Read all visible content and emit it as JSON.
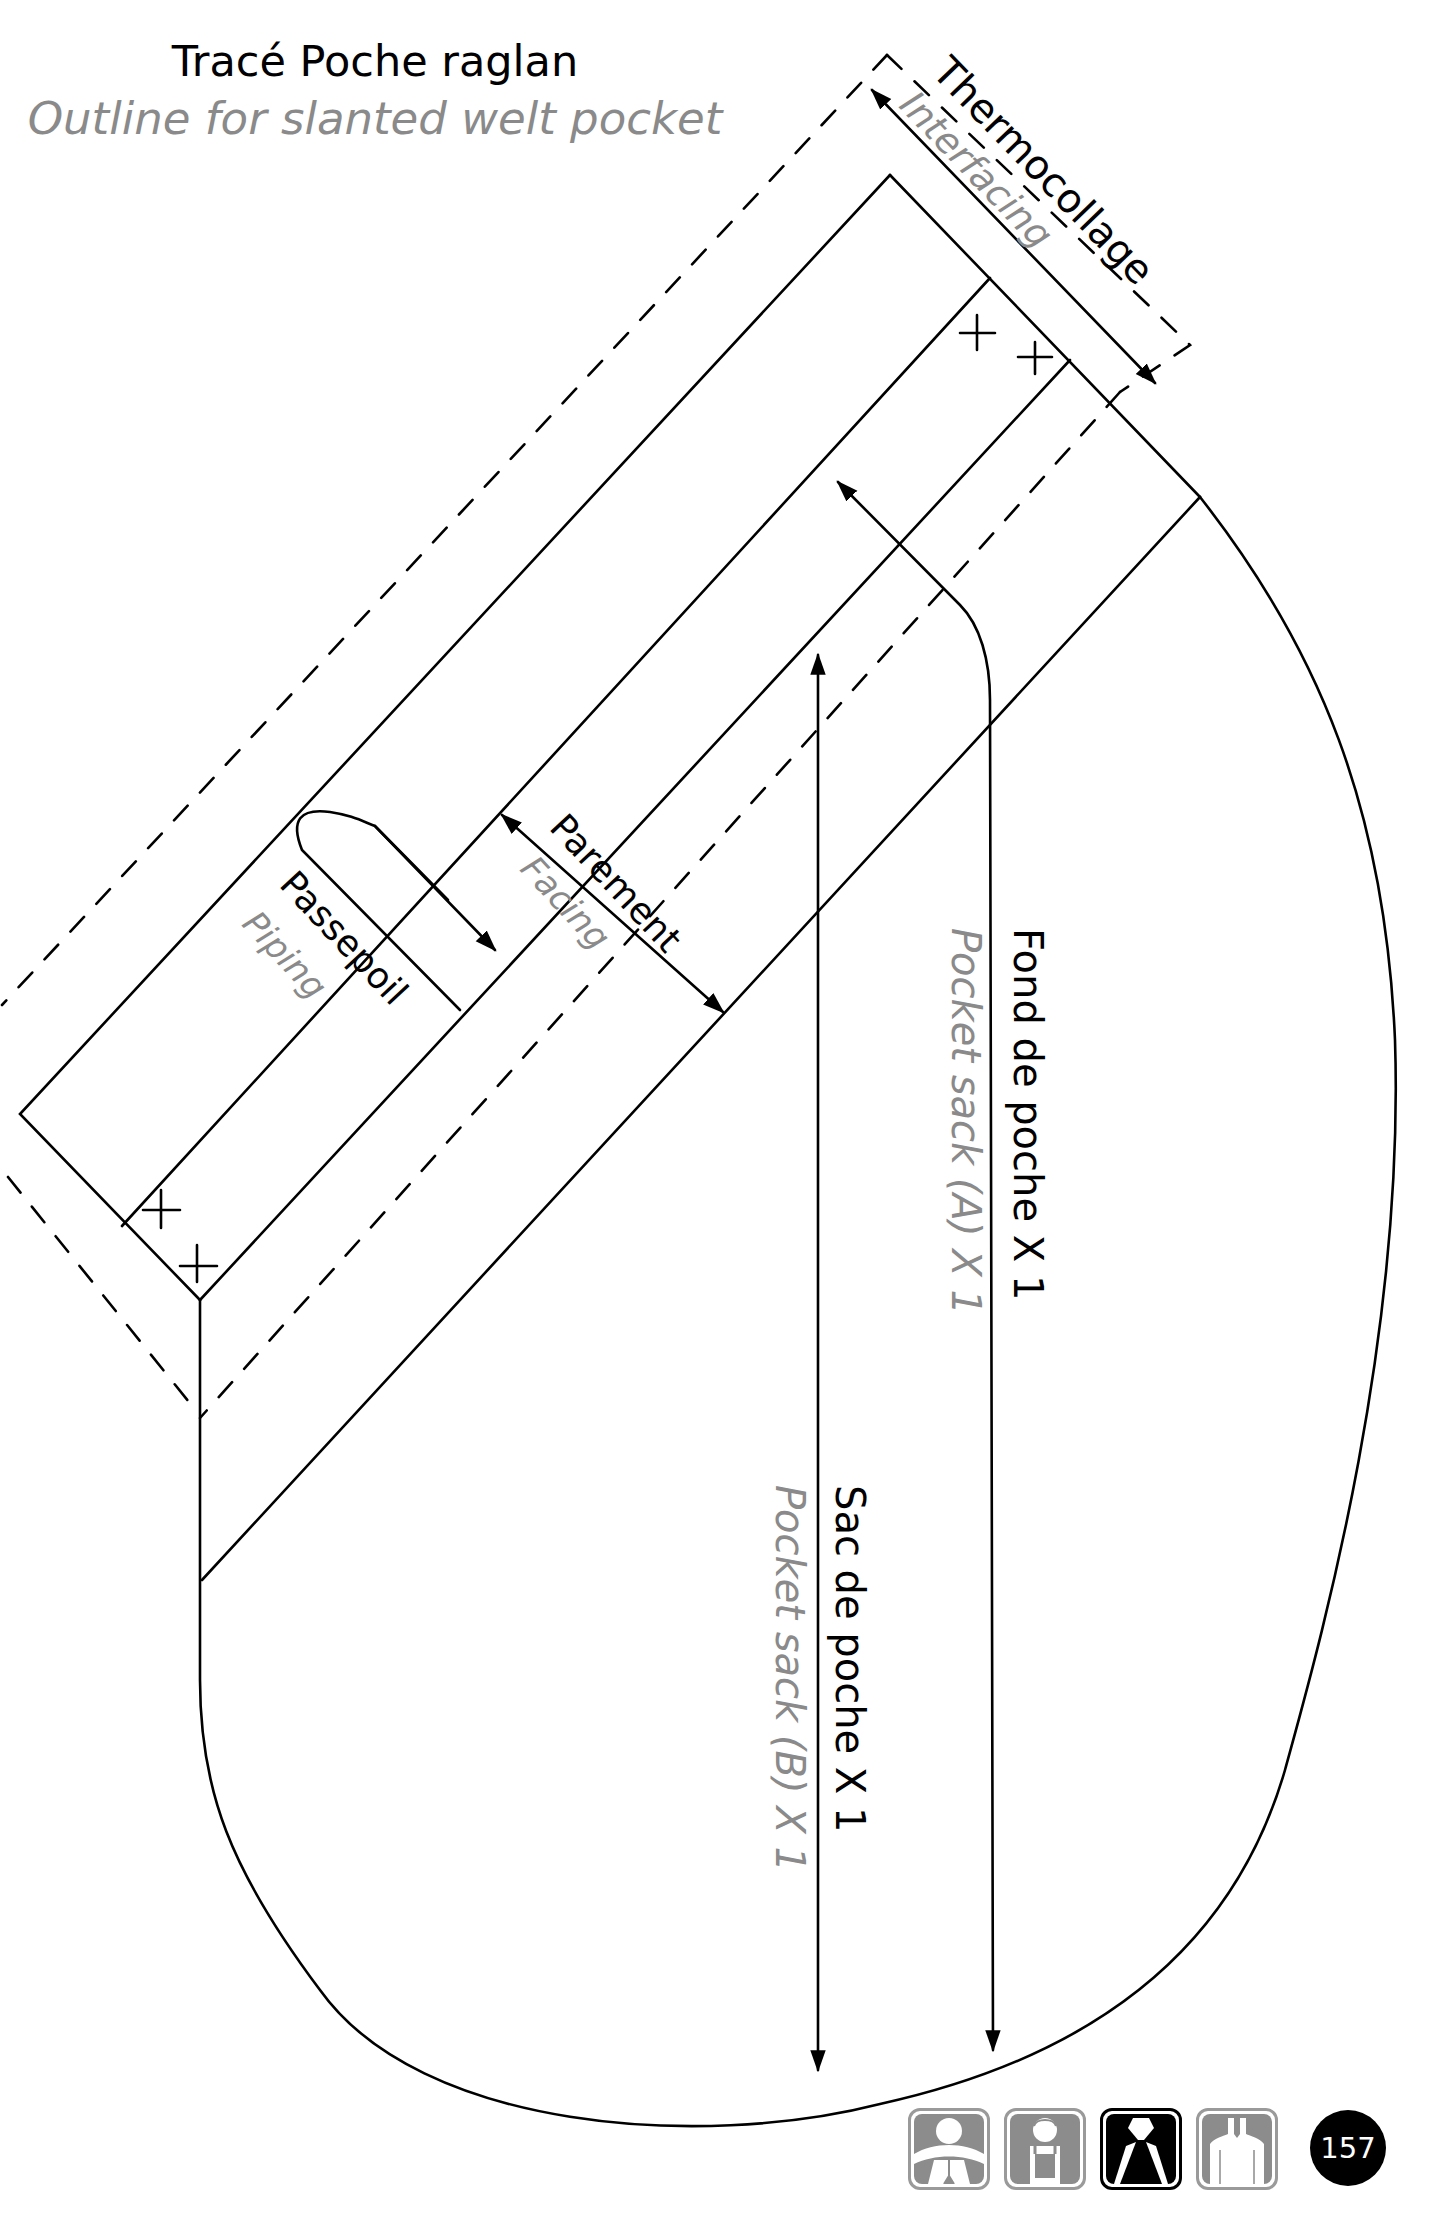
{
  "title": {
    "french": "Tracé Poche raglan",
    "english": "Outline for slanted welt pocket"
  },
  "labels": {
    "interfacing": {
      "french": "Thermocollage",
      "english": "Interfacing"
    },
    "piping": {
      "french": "Passepoil",
      "english": "Piping"
    },
    "facing": {
      "french": "Parement",
      "english": "Facing"
    },
    "pocket_sack_a": {
      "french": "Fond de poche X 1",
      "english": "Pocket sack (A) X 1"
    },
    "pocket_sack_b": {
      "french": "Sac de poche X 1",
      "english": "Pocket sack (B) X 1"
    }
  },
  "footer": {
    "page_number": "157",
    "icons": [
      {
        "name": "person-shoulders-icon",
        "active": false
      },
      {
        "name": "child-overalls-icon",
        "active": false
      },
      {
        "name": "jacket-collar-icon",
        "active": true
      },
      {
        "name": "shirt-neckline-icon",
        "active": false
      }
    ]
  },
  "colors": {
    "line": "#000000",
    "secondary_text": "#8a8a8a",
    "icon_gray": "#8c8c8c"
  }
}
